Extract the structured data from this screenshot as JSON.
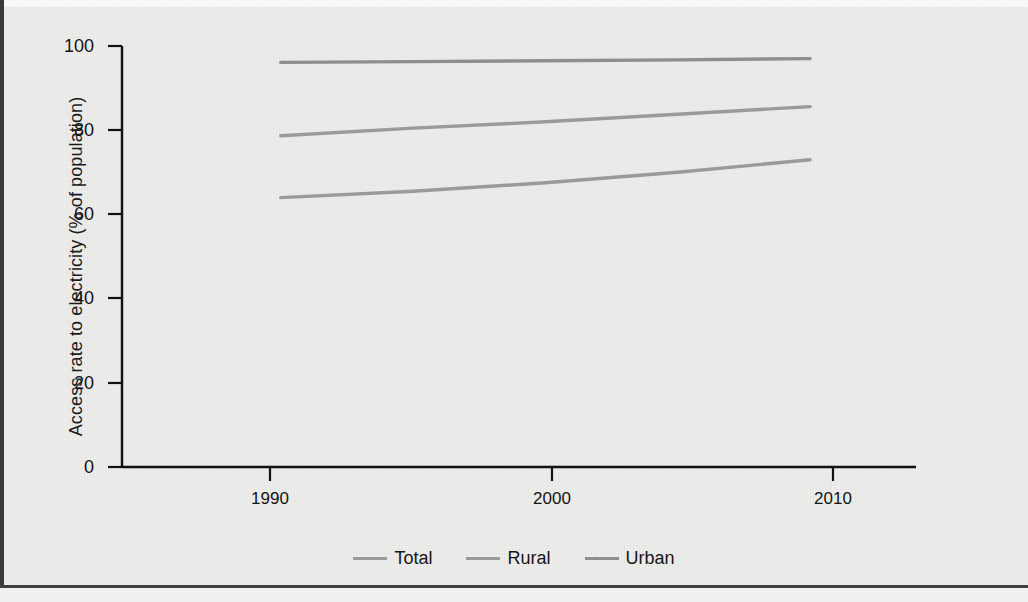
{
  "figure": {
    "background_color": "#ececeb",
    "axis_color": "#111111"
  },
  "legend": {
    "position": "bottom-center",
    "items": [
      {
        "label": "Total",
        "color": "#9a9a9a",
        "icon": "line-swatch-icon"
      },
      {
        "label": "Rural",
        "color": "#9a9a9a",
        "icon": "line-swatch-icon"
      },
      {
        "label": "Urban",
        "color": "#8e8e8e",
        "icon": "line-swatch-icon"
      }
    ]
  },
  "axes": {
    "y_label": "Access rate to electricity (% of population)",
    "y_ticks": [
      "0",
      "20",
      "40",
      "60",
      "80",
      "100"
    ],
    "x_ticks": [
      "1990",
      "2000",
      "2010"
    ],
    "x_label": ""
  },
  "chart_data": {
    "type": "line",
    "title": "",
    "subtitle": "",
    "xlabel": "",
    "ylabel": "Access rate to electricity (% of population)",
    "xlim": [
      1984,
      2014
    ],
    "ylim": [
      0,
      100
    ],
    "yticks": [
      0,
      20,
      40,
      60,
      80,
      100
    ],
    "xticks": [
      1990,
      2000,
      2010
    ],
    "grid": false,
    "legend_position": "bottom-center",
    "x": [
      1990,
      1995,
      2000,
      2005,
      2010
    ],
    "series": [
      {
        "name": "Total",
        "color": "#9a9a9a",
        "values": [
          64.0,
          65.5,
          67.5,
          70.0,
          73.0
        ]
      },
      {
        "name": "Rural",
        "color": "#9a9a9a",
        "values": [
          78.7,
          80.5,
          82.0,
          83.8,
          85.6
        ]
      },
      {
        "name": "Urban",
        "color": "#8e8e8e",
        "values": [
          96.1,
          96.3,
          96.5,
          96.7,
          97.0
        ]
      }
    ]
  }
}
